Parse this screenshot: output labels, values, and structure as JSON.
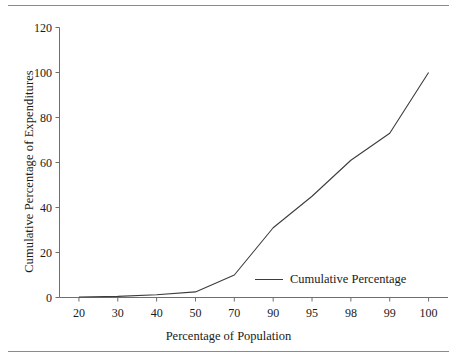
{
  "figure": {
    "has_top_rule": true,
    "has_bottom_rule": true,
    "rule_color": "#8a8a8a",
    "line_color": "#3c3c3c",
    "axis_color": "#6e6e6e",
    "background": "#ffffff"
  },
  "chart_data": {
    "type": "line",
    "title": "",
    "xlabel": "Percentage of Population",
    "ylabel": "Cumulative Percentage of Expenditures",
    "categories": [
      "20",
      "30",
      "40",
      "50",
      "70",
      "90",
      "95",
      "98",
      "99",
      "100"
    ],
    "x_tick_labels": [
      "20",
      "30",
      "40",
      "50",
      "70",
      "90",
      "95",
      "98",
      "99",
      "100"
    ],
    "y_tick_labels": [
      "0",
      "20",
      "40",
      "60",
      "80",
      "100",
      "120"
    ],
    "y_ticks": [
      0,
      20,
      40,
      60,
      80,
      100,
      120
    ],
    "ylim": [
      0,
      120
    ],
    "grid": false,
    "legend_position": "inside-lower-right",
    "series": [
      {
        "name": "Cumulative Percentage",
        "values": [
          0.2,
          0.5,
          1.2,
          2.5,
          10,
          31,
          45,
          61,
          73,
          100
        ]
      }
    ]
  },
  "legend": {
    "entries": [
      {
        "label": "Cumulative Percentage",
        "color": "#3c3c3c"
      }
    ]
  }
}
